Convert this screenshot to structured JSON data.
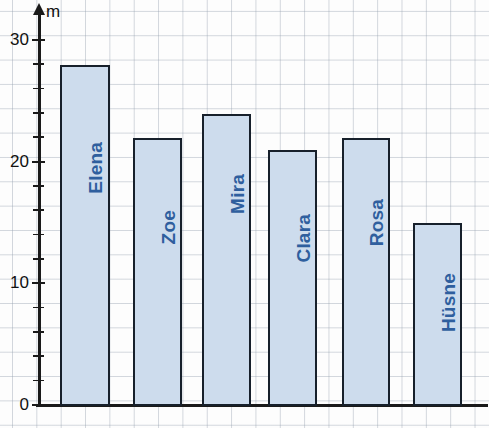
{
  "chart_data": {
    "type": "bar",
    "title": "",
    "xlabel": "",
    "ylabel": "m",
    "ylim": [
      0,
      30
    ],
    "grid": true,
    "legend": "none",
    "orientation": "vertical",
    "categories": [
      "Elena",
      "Zoe",
      "Mira",
      "Clara",
      "Rosa",
      "Hüsne"
    ],
    "values": [
      28,
      22,
      24,
      21,
      22,
      15
    ],
    "y_tick_labels": [
      "0",
      "10",
      "20",
      "30"
    ],
    "y_tick_values": [
      0,
      10,
      20,
      30
    ],
    "y_minor_tick_step": 2,
    "bar_fill_color": "#cddced",
    "bar_border_color": "#17202b",
    "label_color": "#2f5f9e",
    "axis_color": "#1a1a1a",
    "grid_color": "#96a0af"
  },
  "axis": {
    "unit_label": "m",
    "ticks": [
      {
        "label": "30",
        "value": 30,
        "major": true
      },
      {
        "label": "",
        "value": 28,
        "major": false
      },
      {
        "label": "",
        "value": 26,
        "major": false
      },
      {
        "label": "",
        "value": 24,
        "major": false
      },
      {
        "label": "",
        "value": 22,
        "major": false
      },
      {
        "label": "20",
        "value": 20,
        "major": true
      },
      {
        "label": "",
        "value": 18,
        "major": false
      },
      {
        "label": "",
        "value": 16,
        "major": false
      },
      {
        "label": "",
        "value": 14,
        "major": false
      },
      {
        "label": "",
        "value": 12,
        "major": false
      },
      {
        "label": "10",
        "value": 10,
        "major": true
      },
      {
        "label": "",
        "value": 8,
        "major": false
      },
      {
        "label": "",
        "value": 6,
        "major": false
      },
      {
        "label": "",
        "value": 4,
        "major": false
      },
      {
        "label": "",
        "value": 2,
        "major": false
      },
      {
        "label": "0",
        "value": 0,
        "major": true
      }
    ]
  },
  "bars": [
    {
      "name": "Elena",
      "value": 28
    },
    {
      "name": "Zoe",
      "value": 22
    },
    {
      "name": "Mira",
      "value": 24
    },
    {
      "name": "Clara",
      "value": 21
    },
    {
      "name": "Rosa",
      "value": 22
    },
    {
      "name": "Hüsne",
      "value": 15
    }
  ]
}
